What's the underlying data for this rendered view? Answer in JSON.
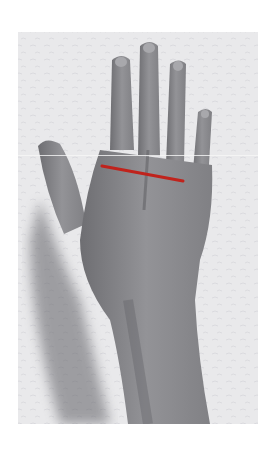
{
  "image": {
    "subject": "Dorsal view of a left hand and wrist on a textured background",
    "style": "grayscale photograph",
    "annotation": {
      "type": "line",
      "color": "#c0231c",
      "description": "Red measurement line across the knuckles (metacarpal width)",
      "start": [
        102,
        166
      ],
      "end": [
        183,
        181
      ]
    },
    "colors": {
      "background": "#e9e9eb",
      "skin": "#8a8a8c",
      "shadow": "#55555a"
    }
  }
}
